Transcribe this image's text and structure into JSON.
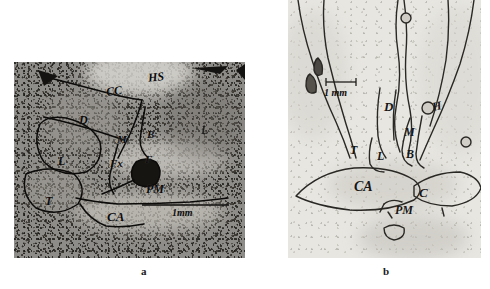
{
  "figure": {
    "panel_count": 2,
    "panels": [
      {
        "id": "a",
        "caption": "a",
        "appearance": "dark grainy coronal brain section photomicrograph",
        "scalebar": {
          "label": "1mm"
        },
        "labels": [
          {
            "text": "HS",
            "x": 134,
            "y": 9
          },
          {
            "text": "CC",
            "x": 92,
            "y": 23
          },
          {
            "text": "D",
            "x": 65,
            "y": 52
          },
          {
            "text": "M",
            "x": 103,
            "y": 72
          },
          {
            "text": "B",
            "x": 133,
            "y": 67
          },
          {
            "text": "L",
            "x": 44,
            "y": 93
          },
          {
            "text": "Fx",
            "x": 96,
            "y": 96
          },
          {
            "text": "F",
            "x": 131,
            "y": 92
          },
          {
            "text": "PM",
            "x": 138,
            "y": 120
          },
          {
            "text": "T",
            "x": 31,
            "y": 133
          },
          {
            "text": "CA",
            "x": 97,
            "y": 149
          },
          {
            "text": "L",
            "x": 187,
            "y": 66
          }
        ]
      },
      {
        "id": "b",
        "caption": "b",
        "appearance": "pale washed-out coronal brain section photomicrograph",
        "scalebar": {
          "label": "1 mm"
        },
        "labels": [
          {
            "text": "D",
            "x": 100,
            "y": 105
          },
          {
            "text": "M",
            "x": 118,
            "y": 131
          },
          {
            "text": "B",
            "x": 118,
            "y": 152
          },
          {
            "text": "H",
            "x": 145,
            "y": 104
          },
          {
            "text": "T",
            "x": 64,
            "y": 148
          },
          {
            "text": "L",
            "x": 91,
            "y": 153
          },
          {
            "text": "CA",
            "x": 72,
            "y": 183
          },
          {
            "text": "C",
            "x": 133,
            "y": 190
          },
          {
            "text": "PM",
            "x": 113,
            "y": 206
          }
        ]
      }
    ]
  }
}
